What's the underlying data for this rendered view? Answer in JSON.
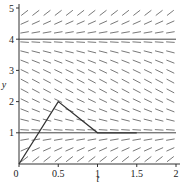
{
  "chart_data": {
    "type": "line",
    "title": "",
    "xlabel": "t",
    "ylabel": "y",
    "xlim": [
      0,
      2
    ],
    "ylim": [
      0,
      5
    ],
    "x_ticks": [
      "0",
      "0.5",
      "1",
      "1.5",
      "2"
    ],
    "y_ticks": [
      "0",
      "1",
      "2",
      "3",
      "4",
      "5"
    ],
    "grid": false,
    "legend": null,
    "slope_field": {
      "description": "Direction field for an autonomous ODE dy/dt = f(y) with equilibria at y=1 and y=4; slopes positive for y<1 and y>4, negative for 1<y<4",
      "equilibria": [
        1,
        4
      ],
      "columns": 14,
      "rows": 16
    },
    "series": [
      {
        "name": "equilibrium y=1",
        "x": [
          0,
          2
        ],
        "y": [
          1,
          1
        ]
      },
      {
        "name": "equilibrium y=4",
        "x": [
          0,
          2
        ],
        "y": [
          4,
          4
        ]
      },
      {
        "name": "trajectory",
        "x": [
          0,
          0.5,
          1,
          1.5
        ],
        "y": [
          0,
          2,
          1,
          1
        ]
      }
    ]
  },
  "colors": {
    "axis": "#333333",
    "slope": "#555555",
    "equilibrium": "#444444",
    "trajectory": "#333333"
  }
}
